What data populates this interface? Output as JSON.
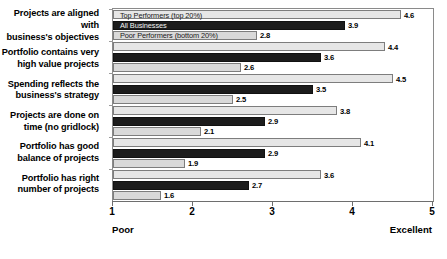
{
  "chart_data": {
    "type": "bar",
    "orientation": "horizontal",
    "title": "",
    "xlabel": "",
    "ylabel": "",
    "xlim": [
      1,
      5
    ],
    "xticks": [
      1,
      2,
      3,
      4,
      5
    ],
    "grid": false,
    "legend_position": "inside-first-group",
    "axis_endpoint_labels": {
      "left": "Poor",
      "right": "Excellent"
    },
    "categories": [
      "Projects are aligned with business's objectives",
      "Portfolio contains very high value projects",
      "Spending reflects the business's strategy",
      "Projects are done on time (no gridlock)",
      "Portfolio has good balance of projects",
      "Portfolio has right number of projects"
    ],
    "category_lines": [
      [
        "Projects are aligned with",
        "business's objectives"
      ],
      [
        "Portfolio contains very",
        "high value projects"
      ],
      [
        "Spending reflects the",
        "business's strategy"
      ],
      [
        "Projects are done on",
        "time (no gridlock)"
      ],
      [
        "Portfolio has good",
        "balance of projects"
      ],
      [
        "Portfolio has right",
        "number of projects"
      ]
    ],
    "series": [
      {
        "name": "Top Performers (top 20%)",
        "color": "#e6e6e6",
        "values": [
          4.6,
          4.4,
          4.5,
          3.8,
          4.1,
          3.6
        ]
      },
      {
        "name": "All Businesses",
        "color": "#1c1c1c",
        "values": [
          3.9,
          3.6,
          3.5,
          2.9,
          2.9,
          2.7
        ]
      },
      {
        "name": "Poor Performers (bottom 20%)",
        "color": "#d9d9d9",
        "values": [
          2.8,
          2.6,
          2.5,
          2.1,
          1.9,
          1.6
        ]
      }
    ]
  }
}
